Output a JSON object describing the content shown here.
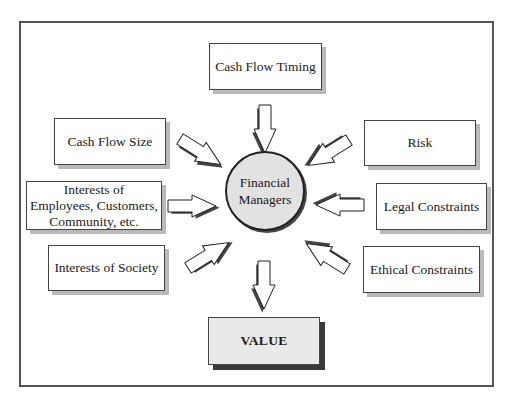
{
  "diagram": {
    "center": {
      "label": "Financial Managers",
      "line1": "Financial",
      "line2": "Managers",
      "fill": "#e2e2e2"
    },
    "inputs": [
      {
        "id": "cash-flow-timing",
        "label": "Cash Flow Timing",
        "position": "top"
      },
      {
        "id": "cash-flow-size",
        "label": "Cash Flow Size",
        "position": "upper-left"
      },
      {
        "id": "interests-stakeholders",
        "line1": "Interests of",
        "line2": "Employees, Customers,",
        "line3": "Community, etc.",
        "position": "left"
      },
      {
        "id": "interests-society",
        "label": "Interests of Society",
        "position": "lower-left"
      },
      {
        "id": "risk",
        "label": "Risk",
        "position": "upper-right"
      },
      {
        "id": "legal-constraints",
        "label": "Legal Constraints",
        "position": "right"
      },
      {
        "id": "ethical-constraints",
        "label": "Ethical Constraints",
        "position": "lower-right"
      }
    ],
    "output": {
      "id": "value",
      "label": "VALUE",
      "position": "bottom",
      "fill": "#e9e9e9"
    },
    "edges": [
      {
        "from": "Cash Flow Timing",
        "to": "Financial Managers"
      },
      {
        "from": "Cash Flow Size",
        "to": "Financial Managers"
      },
      {
        "from": "Interests of Employees, Customers, Community, etc.",
        "to": "Financial Managers"
      },
      {
        "from": "Interests of Society",
        "to": "Financial Managers"
      },
      {
        "from": "Risk",
        "to": "Financial Managers"
      },
      {
        "from": "Legal Constraints",
        "to": "Financial Managers"
      },
      {
        "from": "Ethical Constraints",
        "to": "Financial Managers"
      },
      {
        "from": "Financial Managers",
        "to": "VALUE"
      }
    ]
  }
}
